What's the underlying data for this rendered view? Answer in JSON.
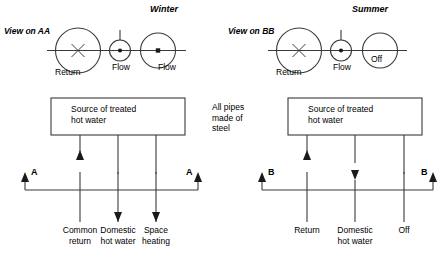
{
  "diagram": {
    "panels": [
      {
        "id": "winter",
        "title": "Winter",
        "view_label": "View on AA",
        "section_letter": "A",
        "valve_labels": {
          "return": "Return",
          "middle": "Flow",
          "right": "Flow"
        },
        "valve_inner": {
          "left_symbol": "X",
          "middle_symbol": "dot",
          "right_symbol": "dot"
        },
        "box_label": "Source of treated\nhot water",
        "pipe_labels": [
          "Common\nreturn",
          "Domestic\nhot water",
          "Space\nheating"
        ],
        "flow_directions": [
          "up",
          "down",
          "down"
        ]
      },
      {
        "id": "summer",
        "title": "Summer",
        "view_label": "View on BB",
        "section_letter": "B",
        "valve_labels": {
          "return": "Return",
          "middle": "Flow",
          "right": "Off"
        },
        "valve_inner": {
          "left_symbol": "X",
          "middle_symbol": "dot",
          "right_symbol": "none"
        },
        "box_label": "Source of treated\nhot water",
        "pipe_labels": [
          "Return",
          "Domestic\nhot water",
          "Off"
        ],
        "flow_directions": [
          "up",
          "down",
          "none"
        ]
      }
    ],
    "note": "All pipes\nmade of\nsteel",
    "colors": {
      "line": "#3a3a3a",
      "text": "#000000",
      "background": "#ffffff"
    }
  }
}
